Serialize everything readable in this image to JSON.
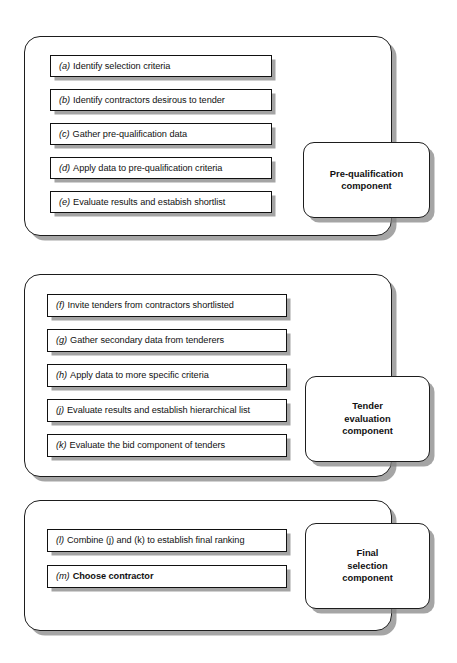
{
  "diagram": {
    "groups": [
      {
        "id": "pre-qualification",
        "component_label": "Pre-qualification\ncomponent",
        "component_line1": "Pre-qualification",
        "component_line2": "component",
        "component_line3": "",
        "steps": [
          {
            "tag": "(a)",
            "text": "Identify selection criteria",
            "bold": false
          },
          {
            "tag": "(b)",
            "text": "Identify contractors desirous to tender",
            "bold": false
          },
          {
            "tag": "(c)",
            "text": "Gather pre-qualification data",
            "bold": false
          },
          {
            "tag": "(d)",
            "text": "Apply data to pre-qualification criteria",
            "bold": false
          },
          {
            "tag": "(e)",
            "text": "Evaluate results and estabish shortlist",
            "bold": false
          }
        ]
      },
      {
        "id": "tender-evaluation",
        "component_label": "Tender\nevaluation\ncomponent",
        "component_line1": "Tender",
        "component_line2": "evaluation",
        "component_line3": "component",
        "steps": [
          {
            "tag": "(f)",
            "text": "Invite tenders from contractors shortlisted",
            "bold": false
          },
          {
            "tag": "(g)",
            "text": "Gather secondary data from tenderers",
            "bold": false
          },
          {
            "tag": "(h)",
            "text": "Apply data to more specific criteria",
            "bold": false
          },
          {
            "tag": "(j)",
            "text": "Evaluate results and establish hierarchical list",
            "bold": false
          },
          {
            "tag": "(k)",
            "text": "Evaluate the bid component of tenders",
            "bold": false
          }
        ]
      },
      {
        "id": "final-selection",
        "component_label": "Final\nselection\ncomponent",
        "component_line1": "Final",
        "component_line2": "selection",
        "component_line3": "component",
        "steps": [
          {
            "tag": "(l)",
            "text": "Combine (j) and (k) to establish final ranking",
            "bold": false
          },
          {
            "tag": "(m)",
            "text": "Choose contractor",
            "bold": true
          }
        ]
      }
    ],
    "colors": {
      "stroke": "#1d1d1d",
      "shadow": "#8a8a8a",
      "background": "#ffffff",
      "text": "#111111"
    }
  }
}
